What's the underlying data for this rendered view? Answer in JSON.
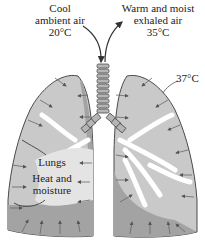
{
  "labels": {
    "inhale_line1": "Cool",
    "inhale_line2": "ambient air",
    "inhale_temp": "20°C",
    "exhale_line1": "Warm and moist",
    "exhale_line2": "exhaled air",
    "exhale_temp": "35°C",
    "lung_temp": "37°C",
    "lungs": "Lungs",
    "heat_line1": "Heat and",
    "heat_line2": "moisture"
  },
  "colors": {
    "lung_fill": "#c9c9c9",
    "lung_dark": "#9c9c9c",
    "bronchi": "#ffffff",
    "outline": "#4a4a4a",
    "trachea": "#b5b5b5"
  }
}
